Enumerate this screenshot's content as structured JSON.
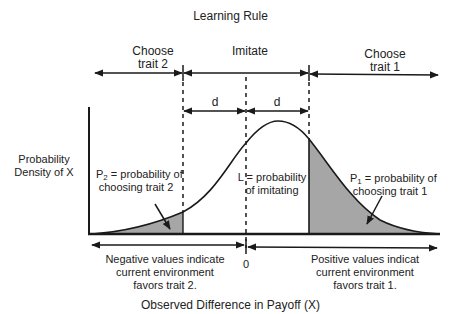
{
  "title": "Learning Rule",
  "regions": {
    "choose_trait2": [
      "Choose",
      "trait 2"
    ],
    "imitate": "Imitate",
    "choose_trait1": [
      "Choose",
      "trait 1"
    ],
    "d_left": "d",
    "d_right": "d"
  },
  "y_axis_label": [
    "Probability",
    "Density of X"
  ],
  "annotations": {
    "p2": {
      "symbol": "P",
      "sub": "2",
      "rest": " = probability of",
      "line2": "choosing trait 2"
    },
    "l": {
      "line1": "L = probability",
      "line2": "of imitating"
    },
    "p1": {
      "symbol": "P",
      "sub": "1",
      "rest": " = probability of",
      "line2": "choosing trait 1"
    }
  },
  "zero_label": "0",
  "negative_note": [
    "Negative values indicate",
    "current environment",
    "favors trait 2."
  ],
  "positive_note": [
    "Positive values indicat",
    "current environment",
    "favors trait 1."
  ],
  "x_axis_label": "Observed Difference in Payoff (X)",
  "colors": {
    "ink": "#1a1a1a",
    "shade": "#a6a6a6"
  }
}
